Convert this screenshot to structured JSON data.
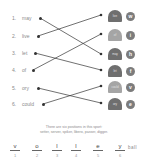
{
  "worksheet": {
    "words": [
      {
        "num": "1.",
        "text": "may"
      },
      {
        "num": "2.",
        "text": "live"
      },
      {
        "num": "3.",
        "text": "let"
      },
      {
        "num": "4.",
        "text": "of"
      },
      {
        "num": "5.",
        "text": "ory"
      },
      {
        "num": "6.",
        "text": "could"
      }
    ],
    "tombstones": [
      {
        "text": "live",
        "shade": "dark"
      },
      {
        "text": "of",
        "shade": "light"
      },
      {
        "text": "may",
        "shade": "dark"
      },
      {
        "text": "let",
        "shade": "dark"
      },
      {
        "text": "could",
        "shade": "light"
      },
      {
        "text": "ory",
        "shade": "dark"
      }
    ],
    "circle_letters": [
      "w",
      "i",
      "h",
      "f",
      "v",
      "e"
    ],
    "matches": [
      [
        1,
        3
      ],
      [
        2,
        1
      ],
      [
        3,
        4
      ],
      [
        4,
        2
      ],
      [
        5,
        6
      ],
      [
        6,
        5
      ]
    ],
    "caption_line1": "There are six positions in this sport:",
    "caption_line2": "setter, server, spiker, libero, passer, digger.",
    "answer_slots": [
      {
        "letter": "v",
        "index": "1"
      },
      {
        "letter": "o",
        "index": "2"
      },
      {
        "letter": "l",
        "index": "3"
      },
      {
        "letter": "l",
        "index": "4"
      },
      {
        "letter": "e",
        "index": "5"
      },
      {
        "letter": "y",
        "index": "6"
      }
    ],
    "answer_suffix": "ball"
  }
}
